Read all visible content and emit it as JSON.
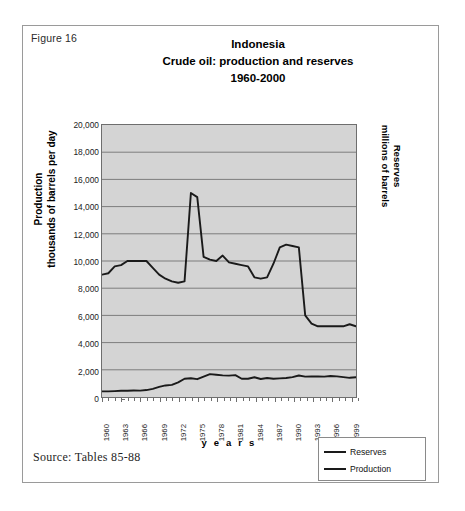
{
  "figure": {
    "number_label": "Figure 16",
    "source_note": "Source: Tables 85-88"
  },
  "chart_data": {
    "type": "line",
    "title": "Indonesia",
    "title_line2": "Crude oil: production and reserves",
    "title_line3": "1960-2000",
    "xlabel": "y e a r s",
    "ylabel_left_line1": "Production",
    "ylabel_left_line2": "thousands of barrels per day",
    "ylabel_right_line1": "Reserves",
    "ylabel_right_line2": "millions of barrels",
    "grid": true,
    "legend_position": "bottom-right",
    "xlim": [
      1960,
      2000
    ],
    "ylim": [
      0,
      20000
    ],
    "ytick_labels": [
      "20,000",
      "18,000",
      "16,000",
      "14,000",
      "12,000",
      "10,000",
      "8,000",
      "6,000",
      "4,000",
      "2,000",
      "0"
    ],
    "ytick_values": [
      20000,
      18000,
      16000,
      14000,
      12000,
      10000,
      8000,
      6000,
      4000,
      2000,
      0
    ],
    "xtick_labels": [
      "1960",
      "1963",
      "1966",
      "1969",
      "1972",
      "1975",
      "1978",
      "1981",
      "1984",
      "1987",
      "1990",
      "1993",
      "1996",
      "1999"
    ],
    "xtick_values": [
      1960,
      1963,
      1966,
      1969,
      1972,
      1975,
      1978,
      1981,
      1984,
      1987,
      1990,
      1993,
      1996,
      1999
    ],
    "x": [
      1960,
      1961,
      1962,
      1963,
      1964,
      1965,
      1966,
      1967,
      1968,
      1969,
      1970,
      1971,
      1972,
      1973,
      1974,
      1975,
      1976,
      1977,
      1978,
      1979,
      1980,
      1981,
      1982,
      1983,
      1984,
      1985,
      1986,
      1987,
      1988,
      1989,
      1990,
      1991,
      1992,
      1993,
      1994,
      1995,
      1996,
      1997,
      1998,
      1999,
      2000
    ],
    "series": [
      {
        "name": "Reserves",
        "color": "#1a1a1a",
        "units": "millions of barrels",
        "values": [
          9000,
          9100,
          9600,
          9700,
          10000,
          10000,
          10000,
          10000,
          9500,
          9000,
          8700,
          8500,
          8400,
          8500,
          15000,
          14700,
          10300,
          10100,
          10000,
          10400,
          9900,
          9800,
          9700,
          9600,
          8800,
          8700,
          8800,
          9800,
          11000,
          11200,
          11100,
          11000,
          6000,
          5400,
          5200,
          5200,
          5200,
          5200,
          5200,
          5350,
          5200
        ]
      },
      {
        "name": "Production",
        "color": "#1a1a1a",
        "units": "thousands of barrels per day",
        "values": [
          410,
          415,
          430,
          455,
          465,
          475,
          470,
          510,
          600,
          740,
          850,
          890,
          1080,
          1340,
          1375,
          1310,
          1500,
          1685,
          1635,
          1590,
          1575,
          1605,
          1340,
          1345,
          1450,
          1325,
          1400,
          1340,
          1370,
          1400,
          1460,
          1580,
          1500,
          1510,
          1510,
          1500,
          1540,
          1520,
          1460,
          1410,
          1450
        ]
      }
    ]
  },
  "legend": {
    "items": [
      {
        "label": "Reserves"
      },
      {
        "label": "Production"
      }
    ]
  }
}
